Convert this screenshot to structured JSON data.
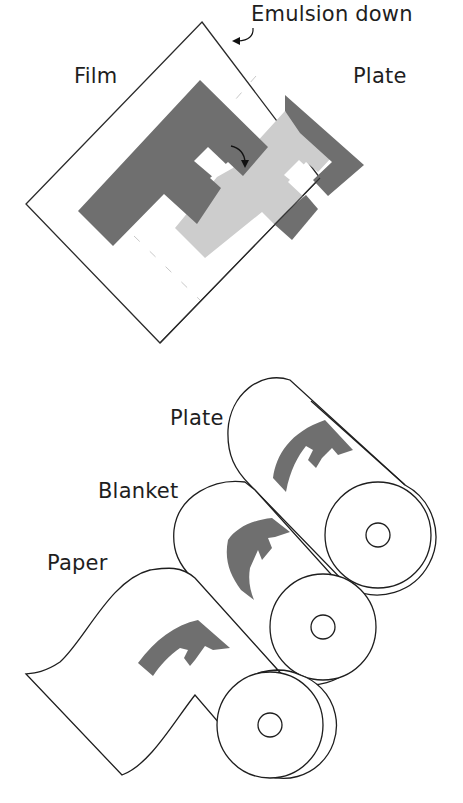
{
  "top_figure": {
    "labels": {
      "emulsion": "Emulsion down",
      "film": "Film",
      "plate": "Plate"
    },
    "icons": [
      "curved-arrow-icon",
      "rotation-arrow-icon"
    ]
  },
  "bottom_figure": {
    "labels": {
      "plate": "Plate",
      "blanket": "Blanket",
      "paper": "Paper"
    },
    "cylinders": [
      "Plate",
      "Blanket",
      "Paper"
    ]
  },
  "colors": {
    "dark_gray": "#6e6e6e",
    "light_gray": "#cfcfcf",
    "line": "#222222",
    "background": "#ffffff"
  }
}
